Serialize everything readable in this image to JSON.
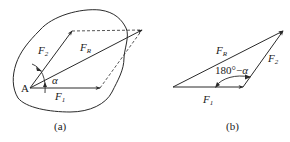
{
  "figure": {
    "colors": {
      "stroke": "#2a2a2a",
      "background": "#ffffff"
    },
    "panel_a": {
      "caption": "(a)",
      "point_label": "A",
      "vectors": [
        {
          "name": "F1",
          "label_main": "F",
          "label_sub": "1",
          "from": [
            30,
            88
          ],
          "to": [
            100,
            88
          ]
        },
        {
          "name": "F2",
          "label_main": "F",
          "label_sub": "2",
          "from": [
            30,
            88
          ],
          "to": [
            72,
            31
          ]
        },
        {
          "name": "FR",
          "label_main": "F",
          "label_sub": "R",
          "from": [
            30,
            88
          ],
          "to": [
            142,
            30
          ]
        }
      ],
      "dashed_lines": [
        {
          "from": [
            72,
            31
          ],
          "to": [
            142,
            30
          ]
        },
        {
          "from": [
            100,
            88
          ],
          "to": [
            142,
            30
          ]
        }
      ],
      "angle_label": "α",
      "body_outline": "rigid body (closed curve)"
    },
    "panel_b": {
      "caption": "(b)",
      "vectors": [
        {
          "name": "F1",
          "label_main": "F",
          "label_sub": "1",
          "from": [
            173,
            87
          ],
          "to": [
            243,
            87
          ]
        },
        {
          "name": "F2",
          "label_main": "F",
          "label_sub": "2",
          "from": [
            243,
            87
          ],
          "to": [
            283,
            31
          ]
        },
        {
          "name": "FR",
          "label_main": "F",
          "label_sub": "R",
          "from": [
            173,
            87
          ],
          "to": [
            283,
            31
          ]
        }
      ],
      "angle_label_num": "180°",
      "angle_label_op": "−",
      "angle_label_sym": "α"
    }
  }
}
